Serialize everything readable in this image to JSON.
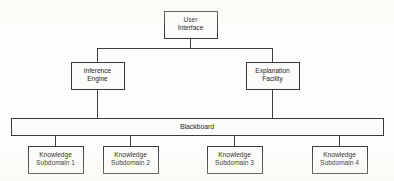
{
  "diagram": {
    "type": "block-diagram",
    "canvas": {
      "width": 394,
      "height": 181
    },
    "colors": {
      "background": "#fdfdfb",
      "box_fill": "#fcfcfa",
      "box_stroke": "#3a3a3a",
      "connector_stroke": "#3f3f3f",
      "text": "#1d1d1d"
    },
    "nodes": [
      {
        "id": "user-interface",
        "lines": [
          "User",
          "Interface"
        ],
        "x": 164,
        "y": 11,
        "w": 53,
        "h": 27
      },
      {
        "id": "inference-engine",
        "lines": [
          "Inference",
          "Engine"
        ],
        "x": 71,
        "y": 62,
        "w": 53,
        "h": 27
      },
      {
        "id": "explanation-facility",
        "lines": [
          "Explanation",
          "Facility"
        ],
        "x": 246,
        "y": 62,
        "w": 53,
        "h": 27
      },
      {
        "id": "knowledge-subdomain-1",
        "lines": [
          "Knowledge",
          "Subdomain 1"
        ],
        "x": 28,
        "y": 146,
        "w": 55,
        "h": 27
      },
      {
        "id": "knowledge-subdomain-2",
        "lines": [
          "Knowledge",
          "Subdomain 2"
        ],
        "x": 103,
        "y": 146,
        "w": 55,
        "h": 27
      },
      {
        "id": "knowledge-subdomain-3",
        "lines": [
          "Knowledge",
          "Subdomain 3"
        ],
        "x": 207,
        "y": 146,
        "w": 55,
        "h": 27
      },
      {
        "id": "knowledge-subdomain-4",
        "lines": [
          "Knowledge",
          "Subdomain 4"
        ],
        "x": 312,
        "y": 146,
        "w": 55,
        "h": 27
      }
    ],
    "blackboard": {
      "id": "blackboard",
      "label": "Blackboard",
      "x": 11,
      "y": 118,
      "w": 372,
      "h": 17
    },
    "connectors": [
      {
        "id": "ui-to-split",
        "from": "user-interface",
        "to": "tier-bus",
        "points": "190,38 190,48"
      },
      {
        "id": "split-bus",
        "from": "tier-bus",
        "to": "tier-bus",
        "points": "97,48 272,48"
      },
      {
        "id": "bus-to-inference",
        "from": "tier-bus",
        "to": "inference-engine",
        "points": "97,48 97,62"
      },
      {
        "id": "bus-to-explanation",
        "from": "tier-bus",
        "to": "explanation-facility",
        "points": "272,48 272,62"
      },
      {
        "id": "inference-to-blackboard",
        "from": "inference-engine",
        "to": "blackboard",
        "points": "97,89 97,118"
      },
      {
        "id": "explanation-to-blackboard",
        "from": "explanation-facility",
        "to": "blackboard",
        "points": "272,89 272,118"
      },
      {
        "id": "blackboard-to-subdomain-1",
        "from": "blackboard",
        "to": "knowledge-subdomain-1",
        "points": "55,135 55,146"
      },
      {
        "id": "blackboard-to-subdomain-2",
        "from": "blackboard",
        "to": "knowledge-subdomain-2",
        "points": "130,135 130,146"
      },
      {
        "id": "blackboard-to-subdomain-3",
        "from": "blackboard",
        "to": "knowledge-subdomain-3",
        "points": "234,135 234,146"
      },
      {
        "id": "blackboard-to-subdomain-4",
        "from": "blackboard",
        "to": "knowledge-subdomain-4",
        "points": "339,135 339,146"
      }
    ]
  }
}
